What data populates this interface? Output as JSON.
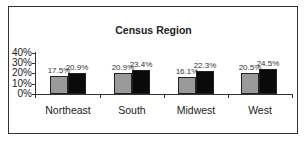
{
  "chart_data": {
    "type": "bar",
    "title": "Census Region",
    "xlabel": "",
    "ylabel": "",
    "ylim": [
      0,
      40
    ],
    "yticks": [
      "0%",
      "10%",
      "20%",
      "30%",
      "40%"
    ],
    "grid": false,
    "legend": null,
    "categories": [
      "Northeast",
      "South",
      "Midwest",
      "West"
    ],
    "series": [
      {
        "name": "Series 1 (gray)",
        "color": "#9a9a9a",
        "values": [
          17.5,
          20.9,
          16.1,
          20.5
        ],
        "labels": [
          "17.5%",
          "20.9%",
          "16.1%",
          "20.5%"
        ]
      },
      {
        "name": "Series 2 (black)",
        "color": "#0a0a0a",
        "values": [
          20.9,
          23.4,
          22.3,
          24.5
        ],
        "labels": [
          "20.9%",
          "23.4%",
          "22.3%",
          "24.5%"
        ]
      }
    ]
  }
}
